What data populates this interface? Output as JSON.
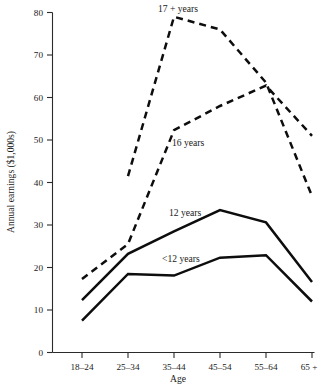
{
  "chart_data": {
    "type": "line",
    "title": "",
    "subtitle": "",
    "xlabel": "Age",
    "ylabel": "Annual earnings ($1,000s)",
    "categories": [
      "18–24",
      "25–34",
      "35–44",
      "45–54",
      "55–64",
      "65 +"
    ],
    "xtick_labels": [
      "18–24",
      "25–34",
      "35–44",
      "45–54",
      "55–64",
      "65 +"
    ],
    "ytick_labels": [
      "0",
      "10",
      "20",
      "30",
      "40",
      "50",
      "60",
      "70",
      "80"
    ],
    "yticks": [
      0,
      10,
      20,
      30,
      40,
      50,
      60,
      70,
      80
    ],
    "ylim": [
      0,
      80
    ],
    "grid": false,
    "legend_position": "inline-annotations",
    "series": [
      {
        "name": "17 + years",
        "style": "dashed",
        "label_text": "17 + years",
        "values": [
          null,
          41.5,
          79.0,
          76.0,
          63.5,
          36.8
        ]
      },
      {
        "name": "16 years",
        "style": "dashed",
        "label_text": "16 years",
        "values": [
          17.3,
          25.5,
          52.3,
          58.0,
          62.8,
          51.0
        ]
      },
      {
        "name": "12 years",
        "style": "solid",
        "label_text": "12 years",
        "values": [
          12.3,
          23.2,
          28.5,
          33.5,
          30.6,
          16.6
        ]
      },
      {
        "name": "<12 years",
        "style": "solid",
        "label_text": "<12 years",
        "values": [
          7.5,
          18.5,
          18.1,
          22.3,
          22.9,
          12.0
        ]
      }
    ],
    "annotations": [
      {
        "text": "17 + years",
        "series": "17 + years"
      },
      {
        "text": "16 years",
        "series": "16 years"
      },
      {
        "text": "12 years",
        "series": "12 years"
      },
      {
        "text": "<12 years",
        "series": "<12 years"
      }
    ],
    "colors": {
      "line": "#0d0d0d",
      "axis": "#2b2b2b",
      "background": "#ffffff",
      "text": "#1a1a1a"
    }
  }
}
